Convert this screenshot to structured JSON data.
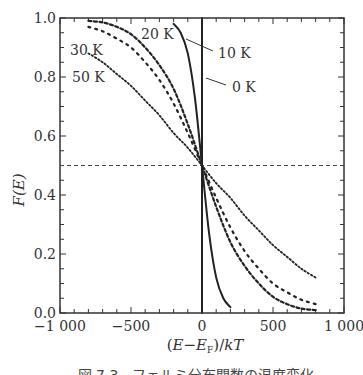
{
  "chart_data": {
    "type": "line",
    "title": "",
    "xlabel": "(E−Eₑ)/kT",
    "xlabel_parts": {
      "open": "(",
      "E": "E",
      "minus": "−",
      "EF": "E",
      "F_sub": "F",
      "close": ")",
      "slash": "/",
      "kT": "kT"
    },
    "ylabel": "F(E)",
    "xlim": [
      -1000,
      1000
    ],
    "ylim": [
      0.0,
      1.0
    ],
    "x_ticks": [
      -1000,
      -500,
      0,
      500,
      1000
    ],
    "x_tick_labels": [
      "−1 000",
      "−500",
      "0",
      "500",
      "1 000"
    ],
    "y_ticks": [
      0.0,
      0.2,
      0.4,
      0.6,
      0.8,
      1.0
    ],
    "y_tick_labels": [
      "0.0",
      "0.2",
      "0.4",
      "0.6",
      "0.8",
      "1.0"
    ],
    "reference_line": {
      "y": 0.5,
      "style": "dashed"
    },
    "series": [
      {
        "name": "0 K",
        "label": "0 K",
        "style": "solid",
        "x": [
          0,
          0
        ],
        "y": [
          1.0,
          0.0
        ]
      },
      {
        "name": "10 K",
        "label": "10 K",
        "style": "solid",
        "x": [
          -200,
          -150,
          -100,
          -50,
          0,
          50,
          100,
          150,
          200
        ],
        "y": [
          0.98,
          0.95,
          0.88,
          0.73,
          0.5,
          0.27,
          0.12,
          0.05,
          0.02
        ]
      },
      {
        "name": "20 K",
        "label": "20 K",
        "style": "dashed",
        "x": [
          -800,
          -700,
          -600,
          -500,
          -400,
          -300,
          -200,
          -100,
          0,
          100,
          200,
          300,
          400,
          500,
          600,
          700,
          800
        ],
        "y": [
          0.99,
          0.985,
          0.97,
          0.945,
          0.9,
          0.84,
          0.76,
          0.64,
          0.5,
          0.36,
          0.24,
          0.16,
          0.1,
          0.055,
          0.03,
          0.015,
          0.01
        ]
      },
      {
        "name": "30 K",
        "label": "30 K",
        "style": "dotted",
        "x": [
          -800,
          -700,
          -600,
          -500,
          -400,
          -300,
          -200,
          -100,
          0,
          100,
          200,
          300,
          400,
          500,
          600,
          700,
          800
        ],
        "y": [
          0.97,
          0.955,
          0.93,
          0.9,
          0.85,
          0.79,
          0.71,
          0.61,
          0.5,
          0.39,
          0.29,
          0.21,
          0.15,
          0.1,
          0.07,
          0.045,
          0.03
        ]
      },
      {
        "name": "50 K",
        "label": "50 K",
        "style": "dense-dotted",
        "x": [
          -800,
          -700,
          -600,
          -500,
          -400,
          -300,
          -200,
          -100,
          0,
          100,
          200,
          300,
          400,
          500,
          600,
          700,
          800
        ],
        "y": [
          0.88,
          0.85,
          0.81,
          0.77,
          0.72,
          0.67,
          0.61,
          0.56,
          0.5,
          0.44,
          0.39,
          0.33,
          0.28,
          0.23,
          0.19,
          0.15,
          0.12
        ]
      }
    ],
    "annotations": [
      {
        "text": "20 K",
        "series": "20 K"
      },
      {
        "text": "30 K",
        "series": "30 K"
      },
      {
        "text": "50 K",
        "series": "50 K"
      },
      {
        "text": "10 K",
        "series": "10 K",
        "leader_line": true
      },
      {
        "text": "0 K",
        "series": "0 K",
        "leader_line": true
      }
    ],
    "grid": false,
    "legend": "none"
  },
  "caption": {
    "text": "図 7.3　フェルミ分布関数の温度変化"
  }
}
